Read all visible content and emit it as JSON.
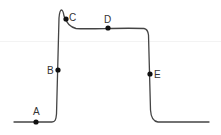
{
  "diagram": {
    "type": "waveform",
    "colors": {
      "line": "#444444",
      "point": "#111111",
      "label": "#333333",
      "background": "#ffffff"
    },
    "points": [
      {
        "id": "A",
        "label": "A",
        "x": 36,
        "y": 122,
        "label_x": 33,
        "label_y": 115
      },
      {
        "id": "B",
        "label": "B",
        "x": 58,
        "y": 70,
        "label_x": 47,
        "label_y": 74
      },
      {
        "id": "C",
        "label": "C",
        "x": 66,
        "y": 19,
        "label_x": 69,
        "label_y": 21
      },
      {
        "id": "D",
        "label": "D",
        "x": 108,
        "y": 28,
        "label_x": 104,
        "label_y": 23
      },
      {
        "id": "E",
        "label": "E",
        "x": 150,
        "y": 74,
        "label_x": 154,
        "label_y": 78
      }
    ]
  }
}
